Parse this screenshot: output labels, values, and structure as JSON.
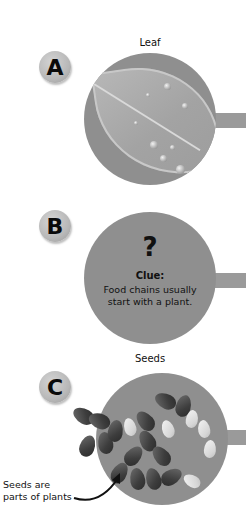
{
  "panels": [
    {
      "badge": "A",
      "title": "Leaf",
      "image": "leaf-with-water-drops"
    },
    {
      "badge": "B",
      "title": "",
      "symbol": "?",
      "clue_label": "Clue:",
      "clue_text": "Food chains usually start with a plant."
    },
    {
      "badge": "C",
      "title": "Seeds",
      "image": "pile-of-seeds"
    }
  ],
  "annotation": {
    "line1": "Seeds are",
    "line2": "parts of plants",
    "icon": "curved-arrow-icon"
  },
  "colors": {
    "circle_fill": "#8f8f8f",
    "connector": "#9a9a9a",
    "badge": "#b8b8b8",
    "text": "#111111"
  }
}
